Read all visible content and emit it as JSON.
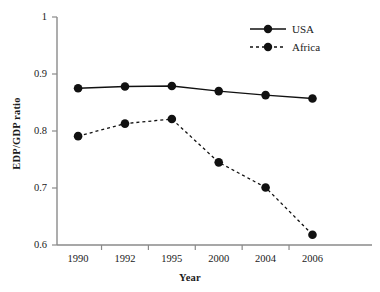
{
  "chart_data": {
    "type": "line",
    "title": "",
    "xlabel": "Year",
    "ylabel": "EDP/GDP ratio",
    "categories": [
      "1990",
      "1992",
      "1995",
      "2000",
      "2004",
      "2006"
    ],
    "ylim": [
      0.6,
      1
    ],
    "yticks": [
      "1",
      "0.9",
      "0.8",
      "0.7",
      "0.6"
    ],
    "ytick_values": [
      1,
      0.9,
      0.8,
      0.7,
      0.6
    ],
    "grid": false,
    "legend_position": "top-right",
    "series": [
      {
        "name": "USA",
        "linestyle": "solid",
        "marker": "filled-circle",
        "color": "#111111",
        "values": [
          0.875,
          0.878,
          0.879,
          0.87,
          0.863,
          0.857
        ]
      },
      {
        "name": "Africa",
        "linestyle": "dashed",
        "marker": "filled-circle",
        "color": "#111111",
        "values": [
          0.791,
          0.813,
          0.821,
          0.745,
          0.701,
          0.618
        ]
      }
    ]
  },
  "axes": {
    "axis_color": "#8a8a8a",
    "tick_color": "#8a8a8a"
  }
}
